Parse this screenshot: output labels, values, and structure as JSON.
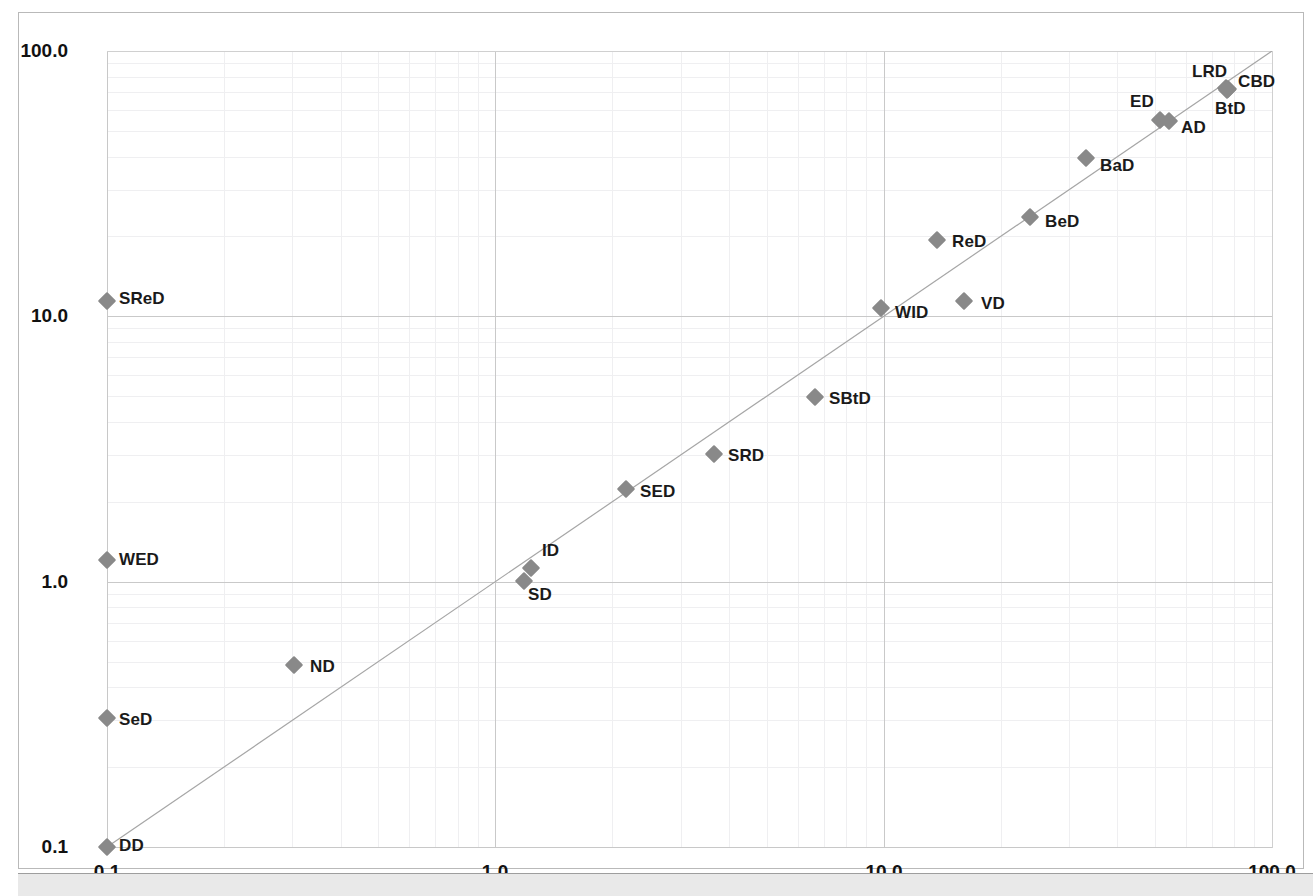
{
  "chart_data": {
    "type": "scatter",
    "title": "",
    "xlabel": "",
    "ylabel": "",
    "xscale": "log",
    "yscale": "log",
    "xlim": [
      0.1,
      100.0
    ],
    "ylim": [
      0.1,
      100.0
    ],
    "grid": true,
    "legend": false,
    "xticks": [
      "0.1",
      "1.0",
      "10.0",
      "100.0"
    ],
    "xtick_values": [
      0.1,
      1.0,
      10.0,
      100.0
    ],
    "yticks": [
      "0.1",
      "1.0",
      "10.0",
      "100.0"
    ],
    "ytick_values": [
      0.1,
      1.0,
      10.0,
      100.0
    ],
    "reference_line": {
      "name": "identity-line",
      "from": [
        0.1,
        0.1
      ],
      "to": [
        100.0,
        100.0
      ],
      "color": "#a6a6a6"
    },
    "marker_color": "#898989",
    "marker_shape": "diamond",
    "points": [
      {
        "label": "SReD",
        "x": 0.1,
        "y": 12.0,
        "px": 88,
        "py": 288,
        "lx": 100,
        "ly": 286
      },
      {
        "label": "WED",
        "x": 0.1,
        "y": 1.22,
        "px": 88,
        "py": 547,
        "lx": 100,
        "ly": 547
      },
      {
        "label": "SeD",
        "x": 0.1,
        "y": 0.3,
        "px": 88,
        "py": 705,
        "lx": 100,
        "ly": 707
      },
      {
        "label": "DD",
        "x": 0.1,
        "y": 0.1,
        "px": 88,
        "py": 834,
        "lx": 100,
        "ly": 833
      },
      {
        "label": "ND",
        "x": 0.3,
        "y": 0.47,
        "px": 275,
        "py": 652,
        "lx": 291,
        "ly": 654
      },
      {
        "label": "SD",
        "x": 1.15,
        "y": 1.0,
        "px": 505,
        "py": 568,
        "lx": 509,
        "ly": 582
      },
      {
        "label": "ID",
        "x": 1.22,
        "y": 1.13,
        "px": 512,
        "py": 555,
        "lx": 523,
        "ly": 538
      },
      {
        "label": "SED",
        "x": 2.05,
        "y": 2.15,
        "px": 607,
        "py": 476,
        "lx": 621,
        "ly": 479
      },
      {
        "label": "SRD",
        "x": 3.55,
        "y": 2.95,
        "px": 695,
        "py": 441,
        "lx": 709,
        "ly": 443
      },
      {
        "label": "SBtD",
        "x": 6.55,
        "y": 4.85,
        "px": 796,
        "py": 384,
        "lx": 810,
        "ly": 386
      },
      {
        "label": "WID",
        "x": 9.8,
        "y": 10.8,
        "px": 862,
        "py": 295,
        "lx": 876,
        "ly": 300
      },
      {
        "label": "VD",
        "x": 15.8,
        "y": 11.9,
        "px": 945,
        "py": 288,
        "lx": 962,
        "ly": 291
      },
      {
        "label": "ReD",
        "x": 13.8,
        "y": 19.5,
        "px": 918,
        "py": 227,
        "lx": 933,
        "ly": 229
      },
      {
        "label": "BeD",
        "x": 22.5,
        "y": 24.5,
        "px": 1011,
        "py": 204,
        "lx": 1026,
        "ly": 209
      },
      {
        "label": "BaD",
        "x": 33.0,
        "y": 38.5,
        "px": 1067,
        "py": 145,
        "lx": 1081,
        "ly": 153
      },
      {
        "label": "ED",
        "x": 48.5,
        "y": 56.0,
        "px": 1141,
        "py": 107,
        "lx": 1111,
        "ly": 89
      },
      {
        "label": "AD",
        "x": 52.0,
        "y": 55.0,
        "px": 1150,
        "py": 108,
        "lx": 1162,
        "ly": 115
      },
      {
        "label": "LRD",
        "x": 73.0,
        "y": 76.0,
        "px": 1207,
        "py": 75,
        "lx": 1173,
        "ly": 59
      },
      {
        "label": "CBD",
        "x": 76.0,
        "y": 74.0,
        "px": 1209,
        "py": 76,
        "lx": 1219,
        "ly": 69
      },
      {
        "label": "BtD",
        "x": 74.0,
        "y": 72.0,
        "px": 1208,
        "py": 77,
        "lx": 1196,
        "ly": 96
      }
    ]
  }
}
